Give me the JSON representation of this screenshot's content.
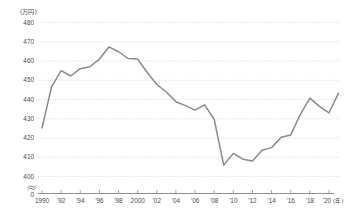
{
  "chart_data": {
    "type": "line",
    "title": "",
    "subtitle": "",
    "unit_label": "(万円)",
    "xlabel": "(年)",
    "ylabel": "",
    "ylim": [
      400,
      480
    ],
    "yticks": [
      400,
      410,
      420,
      430,
      440,
      450,
      460,
      470,
      480
    ],
    "y_axis_break": true,
    "y_axis_zero_label": "0",
    "grid": true,
    "legend": "none",
    "xlim": [
      1990,
      2021
    ],
    "xticks": [
      1990,
      1992,
      1994,
      1996,
      1998,
      2000,
      2002,
      2004,
      2006,
      2008,
      2010,
      2012,
      2014,
      2016,
      2018,
      2020
    ],
    "xtick_labels": [
      "1990",
      "'92",
      "'94",
      "'96",
      "'98",
      "2000",
      "'02",
      "'04",
      "'06",
      "'08",
      "'10",
      "'12",
      "'14",
      "'16",
      "'18",
      "'20"
    ],
    "line_color": "#8a8a8a",
    "grid_color": "#c9c9c9",
    "axis_color": "#8f8f8f",
    "x": [
      1990,
      1991,
      1992,
      1993,
      1994,
      1995,
      1996,
      1997,
      1998,
      1999,
      2000,
      2001,
      2002,
      2003,
      2004,
      2005,
      2006,
      2007,
      2008,
      2009,
      2010,
      2011,
      2012,
      2013,
      2014,
      2015,
      2016,
      2017,
      2018,
      2019,
      2020,
      2021
    ],
    "values": [
      425.2,
      446.6,
      455.0,
      452.2,
      456.0,
      457.0,
      461.0,
      467.3,
      464.8,
      461.3,
      461.0,
      454.0,
      447.8,
      443.9,
      438.8,
      436.8,
      434.5,
      437.2,
      429.6,
      405.9,
      412.0,
      409.0,
      408.0,
      413.6,
      415.0,
      420.4,
      421.6,
      432.2,
      440.7,
      436.4,
      433.1,
      443.3
    ]
  },
  "axis": {
    "unit_label": "(万円)",
    "x_unit": "(年)",
    "zero": "0"
  }
}
